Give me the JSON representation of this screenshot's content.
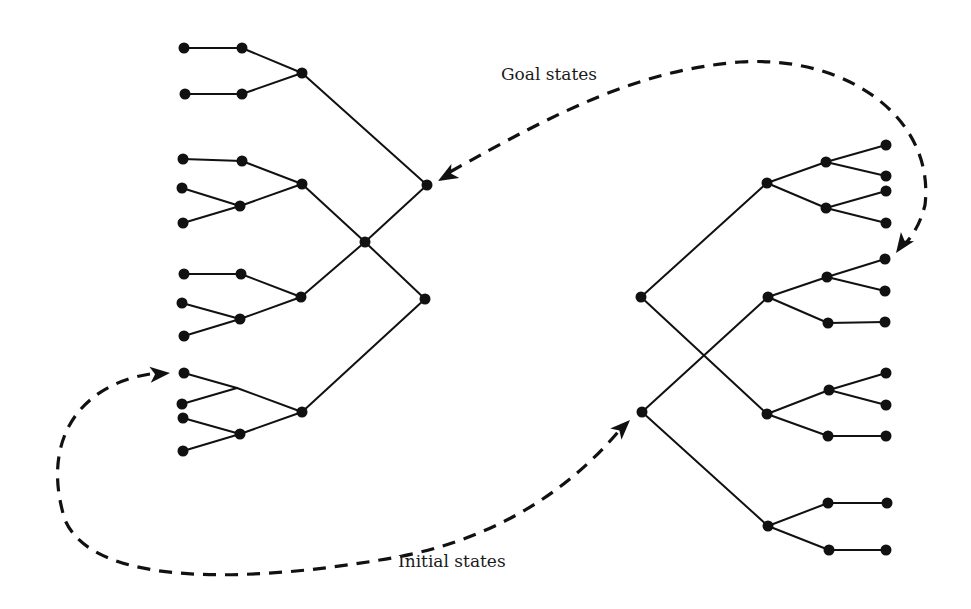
{
  "labels": {
    "goal": "Goal states",
    "initial": "Initial states"
  },
  "colors": {
    "ink": "#111111",
    "background": "#ffffff"
  },
  "left_tree": {
    "nodes": [
      {
        "id": "L_root",
        "x": 365,
        "y": 242
      },
      {
        "id": "L_goal",
        "x": 427,
        "y": 185
      },
      {
        "id": "L_low",
        "x": 425,
        "y": 299
      },
      {
        "id": "L_g1",
        "x": 302,
        "y": 73
      },
      {
        "id": "L_g2",
        "x": 302,
        "y": 184
      },
      {
        "id": "L_g3",
        "x": 301,
        "y": 297
      },
      {
        "id": "L_g4",
        "x": 302,
        "y": 412
      },
      {
        "id": "L_m1a",
        "x": 242,
        "y": 48
      },
      {
        "id": "L_m1b",
        "x": 242,
        "y": 94
      },
      {
        "id": "L_m2a",
        "x": 242,
        "y": 161
      },
      {
        "id": "L_m2b",
        "x": 240,
        "y": 206
      },
      {
        "id": "L_m3a",
        "x": 241,
        "y": 274
      },
      {
        "id": "L_m3b",
        "x": 240,
        "y": 319
      },
      {
        "id": "L_m4b",
        "x": 240,
        "y": 434
      },
      {
        "id": "L_l1a",
        "x": 184,
        "y": 48
      },
      {
        "id": "L_l1b",
        "x": 185,
        "y": 94
      },
      {
        "id": "L_l2a",
        "x": 183,
        "y": 159
      },
      {
        "id": "L_l2b",
        "x": 182,
        "y": 188
      },
      {
        "id": "L_l2c",
        "x": 183,
        "y": 223
      },
      {
        "id": "L_l3a",
        "x": 184,
        "y": 274
      },
      {
        "id": "L_l3b",
        "x": 182,
        "y": 303
      },
      {
        "id": "L_l3c",
        "x": 184,
        "y": 336
      },
      {
        "id": "L_l4a",
        "x": 184,
        "y": 373
      },
      {
        "id": "L_l4b",
        "x": 182,
        "y": 404
      },
      {
        "id": "L_l4c",
        "x": 183,
        "y": 418
      },
      {
        "id": "L_l4d",
        "x": 183,
        "y": 451
      }
    ],
    "junctions": [
      {
        "id": "L_m4a",
        "x": 237,
        "y": 388
      }
    ],
    "edges": [
      [
        "L_root",
        "L_goal"
      ],
      [
        "L_root",
        "L_low"
      ],
      [
        "L_goal",
        "L_g1"
      ],
      [
        "L_root",
        "L_g2"
      ],
      [
        "L_root",
        "L_g3"
      ],
      [
        "L_low",
        "L_g4"
      ],
      [
        "L_g1",
        "L_m1a"
      ],
      [
        "L_g1",
        "L_m1b"
      ],
      [
        "L_m1a",
        "L_l1a"
      ],
      [
        "L_m1b",
        "L_l1b"
      ],
      [
        "L_g2",
        "L_m2a"
      ],
      [
        "L_g2",
        "L_m2b"
      ],
      [
        "L_m2a",
        "L_l2a"
      ],
      [
        "L_m2b",
        "L_l2b"
      ],
      [
        "L_m2b",
        "L_l2c"
      ],
      [
        "L_g3",
        "L_m3a"
      ],
      [
        "L_g3",
        "L_m3b"
      ],
      [
        "L_m3a",
        "L_l3a"
      ],
      [
        "L_m3b",
        "L_l3b"
      ],
      [
        "L_m3b",
        "L_l3c"
      ],
      [
        "L_g4",
        "L_m4a"
      ],
      [
        "L_m4a",
        "L_l4a"
      ],
      [
        "L_m4a",
        "L_l4b"
      ],
      [
        "L_g4",
        "L_m4b"
      ],
      [
        "L_m4b",
        "L_l4c"
      ],
      [
        "L_m4b",
        "L_l4d"
      ]
    ]
  },
  "right_tree": {
    "nodes": [
      {
        "id": "R_a",
        "x": 641,
        "y": 297
      },
      {
        "id": "R_b",
        "x": 642,
        "y": 412
      },
      {
        "id": "R_g1",
        "x": 767,
        "y": 183
      },
      {
        "id": "R_g2",
        "x": 768,
        "y": 297
      },
      {
        "id": "R_g3",
        "x": 767,
        "y": 414
      },
      {
        "id": "R_g4",
        "x": 768,
        "y": 526
      },
      {
        "id": "R_m1a",
        "x": 826,
        "y": 162
      },
      {
        "id": "R_m1b",
        "x": 826,
        "y": 208
      },
      {
        "id": "R_m2a",
        "x": 827,
        "y": 277
      },
      {
        "id": "R_m2b",
        "x": 828,
        "y": 323
      },
      {
        "id": "R_m3a",
        "x": 829,
        "y": 390
      },
      {
        "id": "R_m3b",
        "x": 828,
        "y": 436
      },
      {
        "id": "R_m4a",
        "x": 828,
        "y": 503
      },
      {
        "id": "R_m4b",
        "x": 829,
        "y": 550
      },
      {
        "id": "R_l1a",
        "x": 886,
        "y": 145
      },
      {
        "id": "R_l1b",
        "x": 886,
        "y": 176
      },
      {
        "id": "R_l1c",
        "x": 886,
        "y": 191
      },
      {
        "id": "R_l1d",
        "x": 886,
        "y": 223
      },
      {
        "id": "R_l2a",
        "x": 885,
        "y": 259
      },
      {
        "id": "R_l2b",
        "x": 885,
        "y": 291
      },
      {
        "id": "R_l2c",
        "x": 885,
        "y": 322
      },
      {
        "id": "R_l3a",
        "x": 886,
        "y": 373
      },
      {
        "id": "R_l3b",
        "x": 886,
        "y": 405
      },
      {
        "id": "R_l3c",
        "x": 886,
        "y": 436
      },
      {
        "id": "R_l4a",
        "x": 887,
        "y": 503
      },
      {
        "id": "R_l4b",
        "x": 886,
        "y": 550
      }
    ],
    "edges": [
      [
        "R_a",
        "R_g1"
      ],
      [
        "R_a",
        "R_g3"
      ],
      [
        "R_b",
        "R_g2"
      ],
      [
        "R_b",
        "R_g4"
      ],
      [
        "R_g1",
        "R_m1a"
      ],
      [
        "R_g1",
        "R_m1b"
      ],
      [
        "R_m1a",
        "R_l1a"
      ],
      [
        "R_m1a",
        "R_l1b"
      ],
      [
        "R_m1b",
        "R_l1c"
      ],
      [
        "R_m1b",
        "R_l1d"
      ],
      [
        "R_g2",
        "R_m2a"
      ],
      [
        "R_g2",
        "R_m2b"
      ],
      [
        "R_m2a",
        "R_l2a"
      ],
      [
        "R_m2a",
        "R_l2b"
      ],
      [
        "R_m2b",
        "R_l2c"
      ],
      [
        "R_g3",
        "R_m3a"
      ],
      [
        "R_g3",
        "R_m3b"
      ],
      [
        "R_m3a",
        "R_l3a"
      ],
      [
        "R_m3a",
        "R_l3b"
      ],
      [
        "R_m3b",
        "R_l3c"
      ],
      [
        "R_g4",
        "R_m4a"
      ],
      [
        "R_g4",
        "R_m4b"
      ],
      [
        "R_m4a",
        "R_l4a"
      ],
      [
        "R_m4b",
        "R_l4b"
      ]
    ]
  },
  "connectors": [
    {
      "name": "goal-states-connector",
      "path": "M 450 172 C 560 110, 640 70, 740 62 C 850 55, 935 120, 925 205 C 920 225, 912 236, 905 244",
      "arrows": [
        {
          "x": 438,
          "y": 181,
          "angle": 150
        },
        {
          "x": 896,
          "y": 253,
          "angle": 125
        }
      ]
    },
    {
      "name": "initial-states-connector",
      "path": "M 150 374 C 80 385, 40 440, 65 520 C 95 590, 260 580, 380 560 C 480 545, 560 500, 618 432",
      "arrows": [
        {
          "x": 170,
          "y": 373,
          "angle": -5
        },
        {
          "x": 630,
          "y": 420,
          "angle": -45
        }
      ]
    }
  ],
  "label_positions": {
    "goal": {
      "x": 501,
      "y": 80
    },
    "initial": {
      "x": 398,
      "y": 567
    }
  }
}
